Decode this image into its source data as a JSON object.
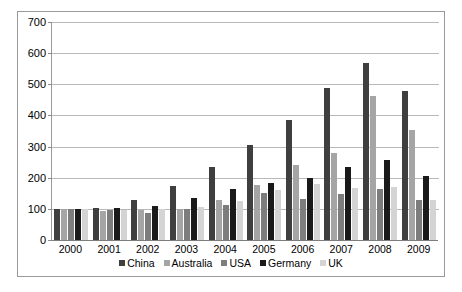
{
  "chart_data": {
    "type": "bar",
    "title": "",
    "subtitle": "",
    "xlabel": "",
    "ylabel": "",
    "ylim": [
      0,
      700
    ],
    "ytick_step": 100,
    "ytick_labels": [
      "0",
      "100",
      "200",
      "300",
      "400",
      "500",
      "600",
      "700"
    ],
    "grid": true,
    "legend_position": "bottom",
    "categories": [
      "2000",
      "2001",
      "2002",
      "2003",
      "2004",
      "2005",
      "2006",
      "2007",
      "2008",
      "2009"
    ],
    "series": [
      {
        "name": "China",
        "color": "#3f3f3f",
        "values": [
          100,
          104,
          128,
          174,
          236,
          304,
          384,
          488,
          570,
          479
        ]
      },
      {
        "name": "Australia",
        "color": "#a5a5a5",
        "values": [
          100,
          92,
          95,
          98,
          128,
          176,
          241,
          278,
          462,
          352
        ]
      },
      {
        "name": "USA",
        "color": "#7d7d7d",
        "values": [
          100,
          97,
          86,
          98,
          113,
          150,
          133,
          148,
          165,
          129
        ]
      },
      {
        "name": "Germany",
        "color": "#1a1a1a",
        "values": [
          100,
          102,
          108,
          134,
          163,
          182,
          200,
          236,
          257,
          204
        ]
      },
      {
        "name": "UK",
        "color": "#d4d4d4",
        "values": [
          100,
          95,
          99,
          106,
          124,
          160,
          180,
          166,
          170,
          130
        ]
      }
    ]
  },
  "legend": {
    "items": [
      {
        "label": "China"
      },
      {
        "label": "Australia"
      },
      {
        "label": "USA"
      },
      {
        "label": "Germany"
      },
      {
        "label": "UK"
      }
    ]
  }
}
